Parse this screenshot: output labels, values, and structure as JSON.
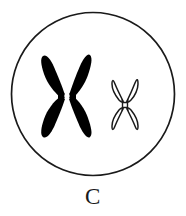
{
  "figure": {
    "caption": "C",
    "background_color": "#ffffff",
    "outline_color": "#1a1a1a"
  },
  "cell": {
    "name": "cell-membrane",
    "shape": "circle",
    "center_x": 93,
    "center_y": 94,
    "radius": 82,
    "stroke_color": "#1a1a1a",
    "stroke_width": 1.6,
    "fill_color": "#ffffff"
  },
  "chromosomes": [
    {
      "id": "large-chromosome",
      "label": "large chromosome",
      "style": "filled",
      "fill_color": "#000000",
      "stroke_color": "#000000",
      "center_x": 67,
      "center_y": 96,
      "width": 50,
      "height": 82,
      "arm_count": 4,
      "centromere": {
        "name": "centromere",
        "style": "white-dot",
        "color": "#ffffff",
        "radius": 2.6
      }
    },
    {
      "id": "small-chromosome",
      "label": "small chromosome",
      "style": "outline",
      "fill_color": "#ffffff",
      "stroke_color": "#1a1a1a",
      "stroke_width": 1.5,
      "center_x": 125,
      "center_y": 105,
      "width": 32,
      "height": 52,
      "arm_count": 4,
      "centromere": {
        "name": "centromere",
        "style": "square-outline",
        "color": "#1a1a1a",
        "size": 5
      }
    }
  ]
}
